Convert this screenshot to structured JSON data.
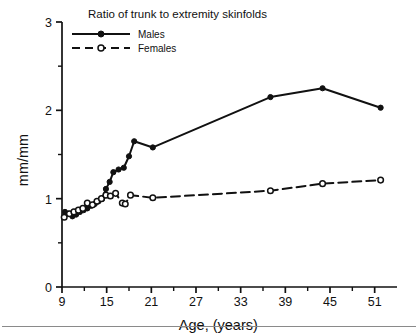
{
  "figure": {
    "title": "Ratio of trunk to extremity skinfolds",
    "x_axis_title": "Age, (years)",
    "y_axis_title": "mm/mm",
    "background": "#ffffff",
    "ink_color": "#111111"
  },
  "legend": {
    "entries": [
      {
        "label": "Males",
        "marker": "filled-circle",
        "line": "solid"
      },
      {
        "label": "Females",
        "marker": "open-circle",
        "line": "dashed"
      }
    ]
  },
  "chart_data": {
    "type": "line",
    "title": "Ratio of trunk to extremity skinfolds",
    "xlabel": "Age, (years)",
    "ylabel": "mm/mm",
    "xlim": [
      9,
      54
    ],
    "ylim": [
      0,
      3
    ],
    "grid": false,
    "legend_position": "top-left",
    "x_major_ticks": [
      9,
      15,
      21,
      27,
      33,
      39,
      45,
      51
    ],
    "x_minor_ticks": [
      12,
      18,
      24,
      30,
      36,
      42,
      48
    ],
    "y_major_ticks": [
      0,
      1,
      2,
      3
    ],
    "y_minor_ticks": [
      0.5,
      1.5,
      2.5
    ],
    "series": [
      {
        "name": "Males",
        "marker": "filled-circle",
        "line": "solid",
        "points": [
          {
            "x": 9.4,
            "y": 0.85
          },
          {
            "x": 9.9,
            "y": 0.83
          },
          {
            "x": 10.4,
            "y": 0.8
          },
          {
            "x": 10.9,
            "y": 0.82
          },
          {
            "x": 11.4,
            "y": 0.85
          },
          {
            "x": 11.9,
            "y": 0.87
          },
          {
            "x": 12.4,
            "y": 0.89
          },
          {
            "x": 12.9,
            "y": 0.92
          },
          {
            "x": 13.4,
            "y": 0.94
          },
          {
            "x": 13.9,
            "y": 0.97
          },
          {
            "x": 14.4,
            "y": 1.0
          },
          {
            "x": 14.9,
            "y": 1.11
          },
          {
            "x": 15.4,
            "y": 1.19
          },
          {
            "x": 15.9,
            "y": 1.3
          },
          {
            "x": 16.6,
            "y": 1.33
          },
          {
            "x": 17.3,
            "y": 1.35
          },
          {
            "x": 18.0,
            "y": 1.48
          },
          {
            "x": 18.7,
            "y": 1.65
          },
          {
            "x": 21.2,
            "y": 1.58
          },
          {
            "x": 37.0,
            "y": 2.15
          },
          {
            "x": 44.0,
            "y": 2.25
          },
          {
            "x": 51.8,
            "y": 2.03
          }
        ]
      },
      {
        "name": "Females",
        "marker": "open-circle",
        "line": "dashed",
        "points": [
          {
            "x": 9.3,
            "y": 0.79
          },
          {
            "x": 10.0,
            "y": 0.83
          },
          {
            "x": 10.6,
            "y": 0.85
          },
          {
            "x": 11.2,
            "y": 0.87
          },
          {
            "x": 11.8,
            "y": 0.89
          },
          {
            "x": 12.4,
            "y": 0.95
          },
          {
            "x": 13.1,
            "y": 0.93
          },
          {
            "x": 13.7,
            "y": 0.97
          },
          {
            "x": 14.3,
            "y": 1.0
          },
          {
            "x": 14.9,
            "y": 1.04
          },
          {
            "x": 15.5,
            "y": 1.03
          },
          {
            "x": 16.2,
            "y": 1.06
          },
          {
            "x": 17.1,
            "y": 0.95
          },
          {
            "x": 17.5,
            "y": 0.94
          },
          {
            "x": 18.2,
            "y": 1.04
          },
          {
            "x": 21.2,
            "y": 1.01
          },
          {
            "x": 37.0,
            "y": 1.09
          },
          {
            "x": 44.0,
            "y": 1.17
          },
          {
            "x": 51.8,
            "y": 1.21
          }
        ]
      }
    ]
  }
}
